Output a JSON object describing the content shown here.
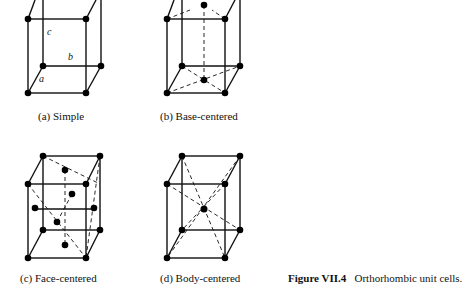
{
  "figure": {
    "number": "Figure VII.4",
    "title": "Orthorhombic unit cells."
  },
  "panels": [
    {
      "id": "a",
      "caption": "(a)  Simple",
      "axis_labels": [
        "a",
        "b",
        "c"
      ]
    },
    {
      "id": "b",
      "caption": "(b)  Base-centered"
    },
    {
      "id": "c",
      "caption": "(c)  Face-centered"
    },
    {
      "id": "d",
      "caption": "(d)  Body-centered"
    }
  ]
}
